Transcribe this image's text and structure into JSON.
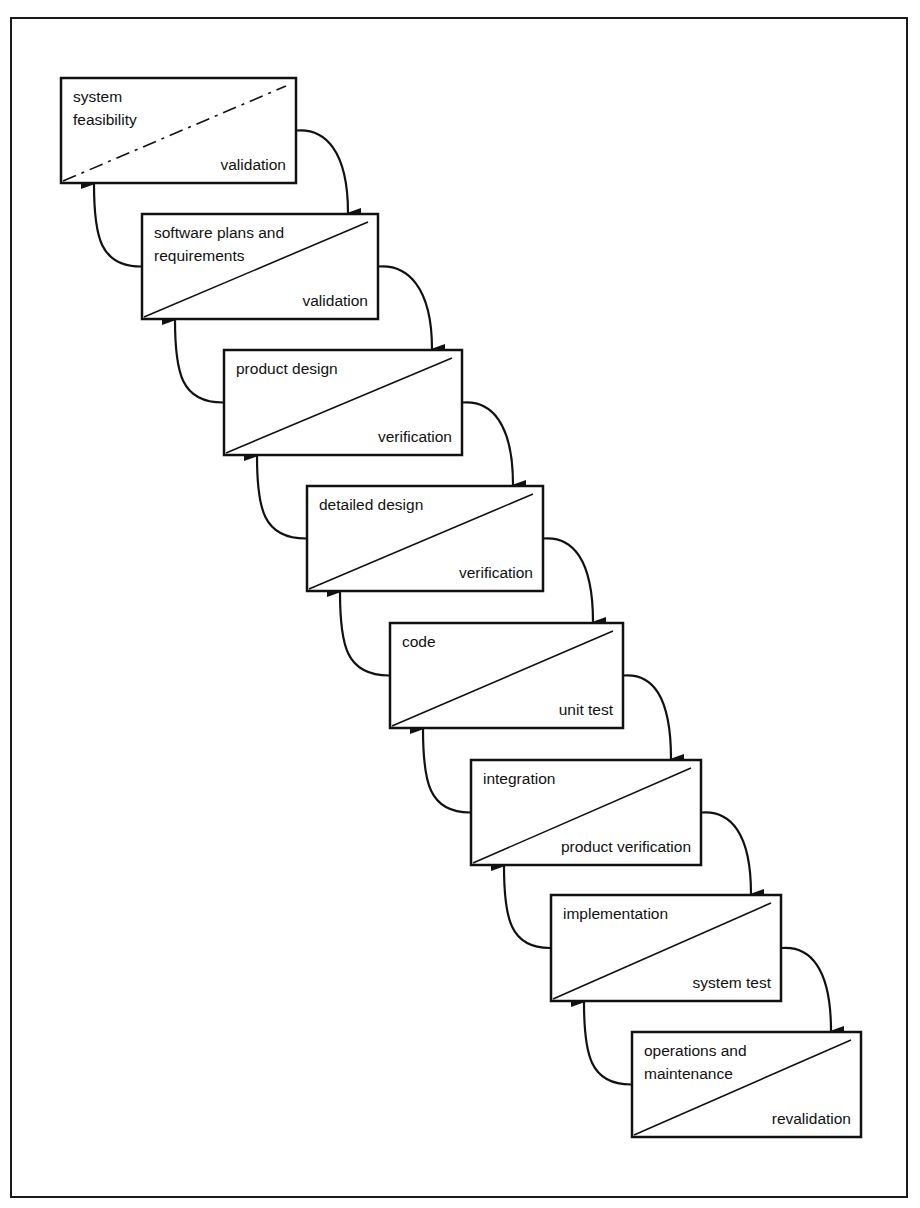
{
  "diagram": {
    "type": "waterfall-model",
    "colors": {
      "line": "#111111",
      "background": "#ffffff"
    },
    "stages": [
      {
        "title": [
          "system",
          "feasibility"
        ],
        "check": "validation",
        "box": [
          61,
          78,
          235,
          105
        ],
        "dashed": true
      },
      {
        "title": [
          "software plans and",
          "requirements"
        ],
        "check": "validation",
        "box": [
          142,
          214,
          236,
          105
        ],
        "dashed": false
      },
      {
        "title": [
          "product design"
        ],
        "check": "verification",
        "box": [
          224,
          350,
          238,
          105
        ],
        "dashed": false
      },
      {
        "title": [
          "detailed design"
        ],
        "check": "verification",
        "box": [
          307,
          486,
          236,
          105
        ],
        "dashed": false
      },
      {
        "title": [
          "code"
        ],
        "check": "unit test",
        "box": [
          390,
          623,
          233,
          105
        ],
        "dashed": false
      },
      {
        "title": [
          "integration"
        ],
        "check": "product verification",
        "box": [
          471,
          760,
          230,
          105
        ],
        "dashed": false
      },
      {
        "title": [
          "implementation"
        ],
        "check": "system test",
        "box": [
          551,
          895,
          230,
          106
        ],
        "dashed": false
      },
      {
        "title": [
          "operations and",
          "maintenance"
        ],
        "check": "revalidation",
        "box": [
          632,
          1032,
          229,
          105
        ],
        "dashed": false
      }
    ],
    "forward_arrows": [
      {
        "from": "system feasibility",
        "to": "software plans and requirements"
      },
      {
        "from": "software plans and requirements",
        "to": "product design"
      },
      {
        "from": "product design",
        "to": "detailed design"
      },
      {
        "from": "detailed design",
        "to": "code"
      },
      {
        "from": "code",
        "to": "integration"
      },
      {
        "from": "integration",
        "to": "implementation"
      },
      {
        "from": "implementation",
        "to": "operations and maintenance"
      }
    ],
    "feedback_arrows": [
      {
        "from": "software plans and requirements",
        "to": "system feasibility"
      },
      {
        "from": "product design",
        "to": "software plans and requirements"
      },
      {
        "from": "detailed design",
        "to": "product design"
      },
      {
        "from": "code",
        "to": "detailed design"
      },
      {
        "from": "integration",
        "to": "code"
      },
      {
        "from": "implementation",
        "to": "integration"
      },
      {
        "from": "operations and maintenance",
        "to": "implementation"
      }
    ]
  }
}
